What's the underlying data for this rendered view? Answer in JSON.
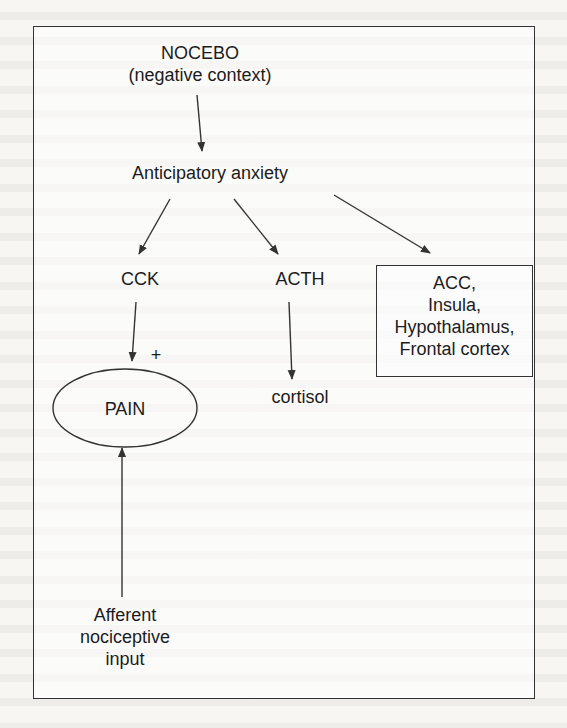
{
  "diagram": {
    "type": "flowchart",
    "nodes": {
      "nocebo": {
        "line1": "NOCEBO",
        "line2": "(negative context)"
      },
      "anxiety": {
        "label": "Anticipatory anxiety"
      },
      "cck": {
        "label": "CCK"
      },
      "acth": {
        "label": "ACTH"
      },
      "regions": {
        "lines": [
          "ACC,",
          "Insula,",
          "Hypothalamus,",
          "Frontal cortex"
        ]
      },
      "pain": {
        "label": "PAIN"
      },
      "cortisol": {
        "label": "cortisol"
      },
      "afferent": {
        "lines": [
          "Afferent",
          "nociceptive",
          "input"
        ]
      }
    },
    "edges": [
      {
        "from": "nocebo",
        "to": "anxiety",
        "label": ""
      },
      {
        "from": "anxiety",
        "to": "cck",
        "label": ""
      },
      {
        "from": "anxiety",
        "to": "acth",
        "label": ""
      },
      {
        "from": "anxiety",
        "to": "regions",
        "label": ""
      },
      {
        "from": "cck",
        "to": "pain",
        "label": "+"
      },
      {
        "from": "acth",
        "to": "cortisol",
        "label": ""
      },
      {
        "from": "afferent",
        "to": "pain",
        "label": ""
      }
    ],
    "plus_sign": "+",
    "colors": {
      "line": "#333333",
      "text": "#1c1c1c",
      "background": "#f7f6f3"
    }
  }
}
